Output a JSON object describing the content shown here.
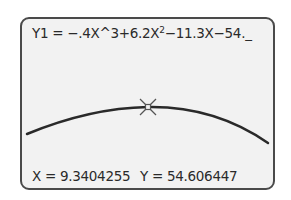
{
  "calculator": {
    "equation": {
      "prefix": "Y1 = −.4X^3+6.2X",
      "exponent": "2",
      "suffix": "−11.3X−54.",
      "cursor": "_"
    },
    "trace": {
      "x_label": "X = 9.3404255",
      "y_label": "Y = 54.606447",
      "x_value": "9.3404255",
      "y_value": "54.606447"
    },
    "cursor_icon": "trace-cursor-icon",
    "colors": {
      "frame": "#4a4a4a",
      "screen": "#f2f2f2",
      "curve": "#2a2a2a",
      "text": "#2a2a2a"
    }
  }
}
